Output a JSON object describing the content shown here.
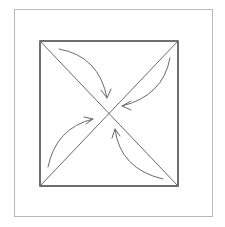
{
  "diagram": {
    "type": "square-with-diagonals-and-inward-arrows",
    "frame": {
      "x": 14,
      "y": 9,
      "width": 199,
      "height": 208,
      "stroke": "#b8b8b8"
    },
    "square": {
      "x": 40,
      "y": 41,
      "width": 138,
      "height": 145,
      "stroke": "#333333",
      "stroke_width": 1.4
    },
    "diagonals": [
      {
        "name": "top-left-to-bottom-right",
        "x1": 40,
        "y1": 41,
        "x2": 178,
        "y2": 186
      },
      {
        "name": "top-right-to-bottom-left",
        "x1": 178,
        "y1": 41,
        "x2": 40,
        "y2": 186
      }
    ],
    "line_color": "#6a6a6a",
    "arrows": [
      {
        "name": "arrow-top-left",
        "direction": "inward-toward-center",
        "path": "M 59 49 Q 99 56 107 98",
        "head": "M 101 90 L 107 98 L 111 89"
      },
      {
        "name": "arrow-top-right",
        "direction": "inward-toward-center",
        "path": "M 170 58 Q 163 96 122 106",
        "head": "M 131 101 L 122 106 L 131 110"
      },
      {
        "name": "arrow-bottom-left",
        "direction": "inward-toward-center",
        "path": "M 48 167 Q 56 128 93 119",
        "head": "M 84 117 L 93 119 L 86 124"
      },
      {
        "name": "arrow-bottom-right",
        "direction": "inward-toward-center",
        "path": "M 163 179 Q 120 169 115 129",
        "head": "M 112 138 L 115 129 L 120 136"
      }
    ]
  }
}
